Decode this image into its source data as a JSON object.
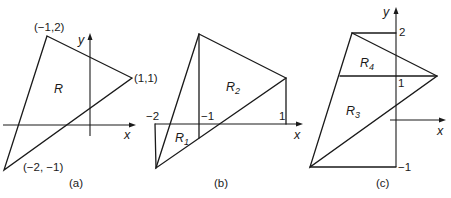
{
  "panels": {
    "a": {
      "caption": "(a)",
      "region_label": "R",
      "axis_x_label": "x",
      "axis_y_label": "y",
      "vertices": {
        "top": "(−1,2)",
        "right": "(1,1)",
        "bottom": "(−2, −1)"
      }
    },
    "b": {
      "caption": "(b)",
      "axis_x_label": "x",
      "region1": {
        "letter": "R",
        "sub": "1"
      },
      "region2": {
        "letter": "R",
        "sub": "2"
      },
      "ticks": {
        "minus2": "−2",
        "minus1": "−1",
        "one": "1"
      }
    },
    "c": {
      "caption": "(c)",
      "axis_x_label": "x",
      "axis_y_label": "y",
      "region3": {
        "letter": "R",
        "sub": "3"
      },
      "region4": {
        "letter": "R",
        "sub": "4"
      },
      "ticks": {
        "two": "2",
        "one": "1",
        "minus1": "−1"
      }
    },
    "left_x_label_c": "x"
  }
}
